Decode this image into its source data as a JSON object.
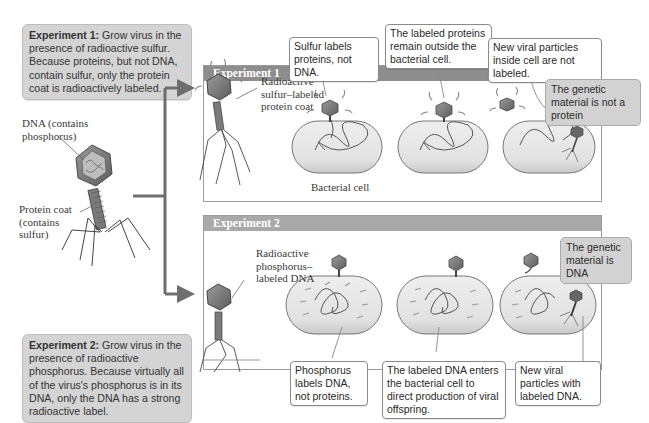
{
  "experiment1_box": {
    "title": "Experiment 1:",
    "text": "Grow virus in the presence of radioactive sulfur. Because proteins, but not DNA, contain sulfur, only the protein coat is radioactively labeled."
  },
  "experiment2_box": {
    "title": "Experiment 2:",
    "text": "Grow virus in the presence of radioactive phosphorus. Because virtually all of the virus's phosphorus is in its DNA, only the DNA has a strong radioactive label."
  },
  "phage_labels": {
    "dna": "DNA (contains phosphorus)",
    "protein_coat": "Protein coat (contains sulfur)"
  },
  "panel1": {
    "header": "Experiment 1",
    "phage_label": "Radioactive sulfur–labeled protein coat",
    "cell_label": "Bacterial cell",
    "callouts": [
      "Sulfur labels proteins, not DNA.",
      "The labeled proteins remain outside the bacterial cell.",
      "New viral particles inside cell are not labeled."
    ],
    "conclusion": "The genetic material is not a protein"
  },
  "panel2": {
    "header": "Experiment 2",
    "phage_label": "Radioactive phosphorus–labeled DNA",
    "callouts": [
      "Phosphorus labels DNA, not proteins.",
      "The labeled DNA enters the bacterial cell to direct production of viral offspring.",
      "New viral particles with labeled DNA."
    ],
    "conclusion": "The genetic material is DNA"
  },
  "colors": {
    "box_fill": "#d4d4d4",
    "header_fill": "#8d8d8d",
    "cell_fill": "#e6e6e6",
    "line": "#777777"
  }
}
